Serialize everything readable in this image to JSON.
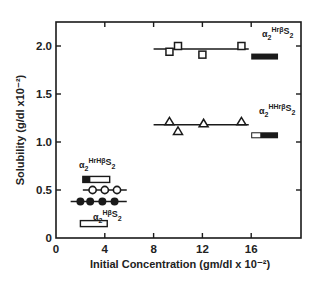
{
  "chart_data": {
    "type": "scatter",
    "title": "",
    "xlabel": "Initial Concentration (gm/dl x 10⁻²)",
    "ylabel": "Solubility (g/dl x10⁻²)",
    "xlim": [
      0,
      20
    ],
    "ylim": [
      0,
      2.25
    ],
    "x_ticks": [
      0,
      4,
      8,
      12,
      16
    ],
    "x_tick_labels": [
      "0",
      "4",
      "8",
      "12",
      "16"
    ],
    "y_ticks": [
      0,
      0.5,
      1.0,
      1.5,
      2.0
    ],
    "y_tick_labels": [
      "0",
      "0.5",
      "1.0",
      "1.5",
      "2.0"
    ],
    "grid": false,
    "legend": "inline labels next to series",
    "series": [
      {
        "name": "α₂HrpS₂ (homozygous)",
        "label_base": "α",
        "label_sub1": "2",
        "label_sup": "Hrβ",
        "label_tail": "S",
        "label_sub2": "2",
        "marker": "open-square",
        "points": [
          [
            9.3,
            1.94
          ],
          [
            10.0,
            2.0
          ],
          [
            12.0,
            1.91
          ],
          [
            15.2,
            2.0
          ]
        ],
        "fit_line": {
          "x": [
            8.0,
            15.8
          ],
          "y": 1.97
        },
        "bar": {
          "x": [
            16.0,
            18.2
          ],
          "y": 1.89,
          "style": "solid-black"
        }
      },
      {
        "name": "α₂HHrpS₂",
        "label_base": "α",
        "label_sub1": "2",
        "label_sup": "HHrβ",
        "label_tail": "S",
        "label_sub2": "2",
        "marker": "open-triangle",
        "points": [
          [
            9.3,
            1.21
          ],
          [
            10.0,
            1.11
          ],
          [
            12.1,
            1.19
          ],
          [
            15.2,
            1.21
          ]
        ],
        "fit_line": {
          "x": [
            8.0,
            15.8
          ],
          "y": 1.18
        },
        "bar": {
          "x": [
            16.0,
            18.2
          ],
          "y": 1.07,
          "style": "open-then-black"
        }
      },
      {
        "name": "α₂HrHpS₂",
        "label_base": "α",
        "label_sub1": "2",
        "label_sup": "HrHβ",
        "label_tail": "S",
        "label_sub2": "2",
        "marker": "open-circle",
        "points": [
          [
            3.0,
            0.5
          ],
          [
            4.0,
            0.5
          ],
          [
            5.0,
            0.5
          ]
        ],
        "fit_line": {
          "x": [
            2.2,
            5.8
          ],
          "y": 0.5
        },
        "bar": {
          "x": [
            2.2,
            4.4
          ],
          "y": 0.61,
          "style": "black-then-open"
        }
      },
      {
        "name": "α₂HpS₂",
        "label_base": "α",
        "label_sub1": "2",
        "label_sup": "Hβ",
        "label_tail": "S",
        "label_sub2": "2",
        "marker": "filled-circle",
        "points": [
          [
            2.0,
            0.38
          ],
          [
            2.8,
            0.38
          ],
          [
            3.8,
            0.38
          ],
          [
            4.8,
            0.38
          ]
        ],
        "fit_line": {
          "x": [
            1.2,
            5.8
          ],
          "y": 0.38
        },
        "bar": {
          "x": [
            2.0,
            4.2
          ],
          "y": 0.15,
          "style": "open"
        }
      }
    ]
  }
}
